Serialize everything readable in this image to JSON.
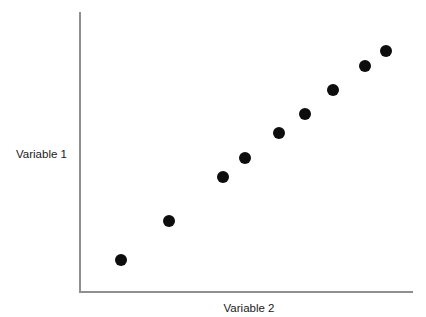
{
  "figure": {
    "background_color": "#ffffff",
    "axis_color": "#8f8f8f",
    "point_color": "#0d0d0d",
    "text_color": "#1a1a1a"
  },
  "chart_data": {
    "type": "scatter",
    "title": "",
    "subtitle": "",
    "xlabel": "Variable 2",
    "ylabel": "Variable 1",
    "xticks": [],
    "yticks": [],
    "xticklabels": [],
    "yticklabels": [],
    "grid": false,
    "legend": false,
    "legend_position": "none",
    "xlim": [
      0,
      10
    ],
    "ylim": [
      0,
      10
    ],
    "annotations": [],
    "marker": {
      "shape": "circle",
      "color": "#0d0d0d",
      "size_px": 12
    },
    "series": [
      {
        "name": "points",
        "x": [
          1.2,
          2.65,
          4.28,
          4.95,
          5.97,
          6.75,
          7.6,
          8.55,
          9.2
        ],
        "y": [
          1.1,
          2.5,
          4.1,
          4.75,
          5.65,
          6.35,
          7.2,
          8.05,
          8.6
        ]
      }
    ]
  }
}
